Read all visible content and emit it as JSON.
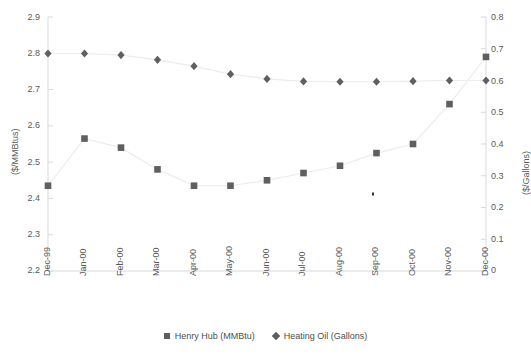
{
  "chart_data": {
    "type": "line",
    "title": "",
    "categories": [
      "Dec-99",
      "Jan-00",
      "Feb-00",
      "Mar-00",
      "Apr-00",
      "May-00",
      "Jun-00",
      "Jul-00",
      "Aug-00",
      "Sep-00",
      "Oct-00",
      "Nov-00",
      "Dec-00"
    ],
    "series": [
      {
        "name": "Henry Hub (MMBtu)",
        "axis": "left",
        "marker": "square",
        "color": "#5f5f5f",
        "values": [
          2.435,
          2.565,
          2.54,
          2.48,
          2.435,
          2.435,
          2.45,
          2.47,
          2.49,
          2.525,
          2.55,
          2.66,
          2.79
        ]
      },
      {
        "name": "Heating Oil (Gallons)",
        "axis": "right",
        "marker": "diamond",
        "color": "#5f5f5f",
        "values": [
          0.685,
          0.685,
          0.68,
          0.665,
          0.645,
          0.62,
          0.605,
          0.597,
          0.596,
          0.596,
          0.598,
          0.6,
          0.6
        ]
      }
    ],
    "xlabel": "",
    "ylabel": "($/MMBtus)",
    "y2label": "($/Gallons)",
    "ylim": [
      2.2,
      2.9
    ],
    "y2lim": [
      0,
      0.8
    ],
    "yticks": [
      "2.2",
      "2.3",
      "2.4",
      "2.5",
      "2.6",
      "2.7",
      "2.8",
      "2.9"
    ],
    "y2ticks": [
      "0",
      "0.1",
      "0.2",
      "0.3",
      "0.4",
      "0.5",
      "0.6",
      "0.7",
      "0.8"
    ],
    "grid": false,
    "legend_position": "bottom"
  },
  "axes": {
    "left_title": "($/MMBtus)",
    "right_title": "($/Gallons)",
    "left_ticks": [
      "2.9",
      "2.8",
      "2.7",
      "2.6",
      "2.5",
      "2.4",
      "2.3",
      "2.2"
    ],
    "right_ticks": [
      "0.8",
      "0.7",
      "0.6",
      "0.5",
      "0.4",
      "0.3",
      "0.2",
      "0.1",
      "0"
    ],
    "x_ticks": [
      "Dec-99",
      "Jan-00",
      "Feb-00",
      "Mar-00",
      "Apr-00",
      "May-00",
      "Jun-00",
      "Jul-00",
      "Aug-00",
      "Sep-00",
      "Oct-00",
      "Nov-00",
      "Dec-00"
    ]
  },
  "legend": {
    "items": [
      {
        "label": "Henry Hub (MMBtu)",
        "marker": "square"
      },
      {
        "label": "Heating Oil (Gallons)",
        "marker": "diamond"
      }
    ]
  },
  "header": {
    "title": ""
  },
  "colors": {
    "series": "#5f5f5f",
    "axis": "#d9d9d9",
    "text": "#595959",
    "line": "#ededed"
  }
}
